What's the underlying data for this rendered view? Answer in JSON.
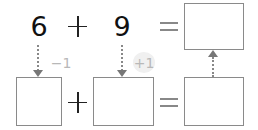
{
  "equation_top": {
    "operand_1": "6",
    "operator_1": "+",
    "operand_2": "9",
    "equals": "=",
    "result_box": ""
  },
  "transforms": {
    "operand_1_adjust": "−1",
    "operand_2_adjust": "+1"
  },
  "equation_bottom": {
    "box_1": "",
    "operator": "+",
    "box_2": "",
    "equals": "=",
    "result_box": ""
  },
  "colors": {
    "digit": "#111111",
    "box_border": "#8a8a8a",
    "arrow": "#777777",
    "badge_text": "#b8b8b8",
    "badge_bg": "#f0f0f0"
  }
}
